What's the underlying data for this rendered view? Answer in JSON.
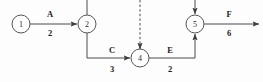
{
  "diagram": {
    "type": "activity-on-arrow-network-diagram",
    "title": "",
    "background_color": "#fdfdfd",
    "line_color": "#4a4a4a",
    "nodes": [
      {
        "id": "node-1",
        "label": "1",
        "cx": 21,
        "cy": 24
      },
      {
        "id": "node-2",
        "label": "2",
        "cx": 87,
        "cy": 24
      },
      {
        "id": "node-4",
        "label": "4",
        "cx": 140,
        "cy": 58
      },
      {
        "id": "node-5",
        "label": "5",
        "cx": 195,
        "cy": 24
      }
    ],
    "node_radius": 9,
    "edges": [
      {
        "id": "edge-a",
        "activity": "A",
        "duration": "2",
        "from": "node-1",
        "to": "node-2",
        "style": "solid",
        "activity_label_pos": {
          "x": 50,
          "y": 14
        },
        "duration_label_pos": {
          "x": 50,
          "y": 33
        }
      },
      {
        "id": "edge-c",
        "activity": "C",
        "duration": "3",
        "from": "node-2",
        "to": "node-4",
        "style": "solid",
        "activity_label_pos": {
          "x": 112,
          "y": 50
        },
        "duration_label_pos": {
          "x": 112,
          "y": 69
        }
      },
      {
        "id": "edge-e",
        "activity": "E",
        "duration": "2",
        "from": "node-4",
        "to": "node-5",
        "style": "solid",
        "activity_label_pos": {
          "x": 170,
          "y": 50
        },
        "duration_label_pos": {
          "x": 170,
          "y": 69
        }
      },
      {
        "id": "edge-f",
        "activity": "F",
        "duration": "6",
        "from": "node-5",
        "to": "",
        "style": "solid",
        "activity_label_pos": {
          "x": 229,
          "y": 14
        },
        "duration_label_pos": {
          "x": 229,
          "y": 33
        }
      },
      {
        "id": "edge-dummy-into-node-4",
        "activity": "",
        "duration": "",
        "from": "",
        "to": "node-4",
        "style": "dashed",
        "activity_label_pos": null,
        "duration_label_pos": null
      },
      {
        "id": "edge-incoming-node-2",
        "activity": "",
        "duration": "",
        "from": "",
        "to": "node-2",
        "style": "solid",
        "activity_label_pos": null,
        "duration_label_pos": null
      },
      {
        "id": "edge-incoming-node-5",
        "activity": "",
        "duration": "",
        "from": "",
        "to": "node-5",
        "style": "solid",
        "activity_label_pos": null,
        "duration_label_pos": null
      }
    ]
  }
}
